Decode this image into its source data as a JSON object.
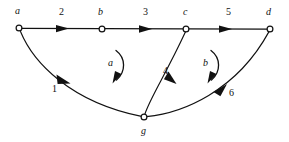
{
  "figure": {
    "type": "directed-graph-diagram",
    "background_color": "#ffffff",
    "stroke_color": "#111111",
    "width": 289,
    "height": 142
  },
  "nodes": [
    {
      "id": "a",
      "label": "a",
      "x": 19,
      "y": 28,
      "label_x": 15,
      "label_y": 14
    },
    {
      "id": "b",
      "label": "b",
      "x": 102,
      "y": 29,
      "label_x": 98,
      "label_y": 15
    },
    {
      "id": "c",
      "label": "c",
      "x": 186,
      "y": 29,
      "label_x": 183,
      "label_y": 15
    },
    {
      "id": "d",
      "label": "d",
      "x": 270,
      "y": 29,
      "label_x": 266,
      "label_y": 15
    },
    {
      "id": "g",
      "label": "g",
      "x": 144,
      "y": 117,
      "label_x": 141,
      "label_y": 134
    }
  ],
  "edges": [
    {
      "id": "a-b",
      "from": "a",
      "to": "b",
      "label": "2",
      "label_x": 59,
      "label_y": 15,
      "shape": "straight"
    },
    {
      "id": "b-c",
      "from": "b",
      "to": "c",
      "label": "3",
      "label_x": 143,
      "label_y": 15,
      "shape": "straight"
    },
    {
      "id": "c-d",
      "from": "c",
      "to": "d",
      "label": "5",
      "label_x": 226,
      "label_y": 15,
      "shape": "straight"
    },
    {
      "id": "a-g",
      "from": "a",
      "to": "g",
      "label": "1",
      "label_x": 52,
      "label_y": 92,
      "shape": "curved"
    },
    {
      "id": "g-c",
      "from": "g",
      "to": "c",
      "label": "4",
      "label_x": 163,
      "label_y": 74,
      "shape": "curved"
    },
    {
      "id": "g-d",
      "from": "g",
      "to": "d",
      "label": "6",
      "label_x": 229,
      "label_y": 96,
      "shape": "curved"
    }
  ],
  "face_arcs": [
    {
      "id": "arc-a",
      "label": "a",
      "label_x": 108,
      "label_y": 66,
      "direction": "clockwise"
    },
    {
      "id": "arc-b",
      "label": "b",
      "label_x": 203,
      "label_y": 66,
      "direction": "clockwise"
    }
  ]
}
